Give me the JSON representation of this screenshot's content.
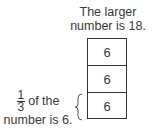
{
  "title": {
    "line1": "The larger",
    "line2": "number is 18."
  },
  "stack": {
    "cells": [
      "6",
      "6",
      "6"
    ]
  },
  "annotation": {
    "fraction_numerator": "1",
    "fraction_denominator": "3",
    "text_after_fraction": "of the",
    "line2": "number is 6."
  }
}
